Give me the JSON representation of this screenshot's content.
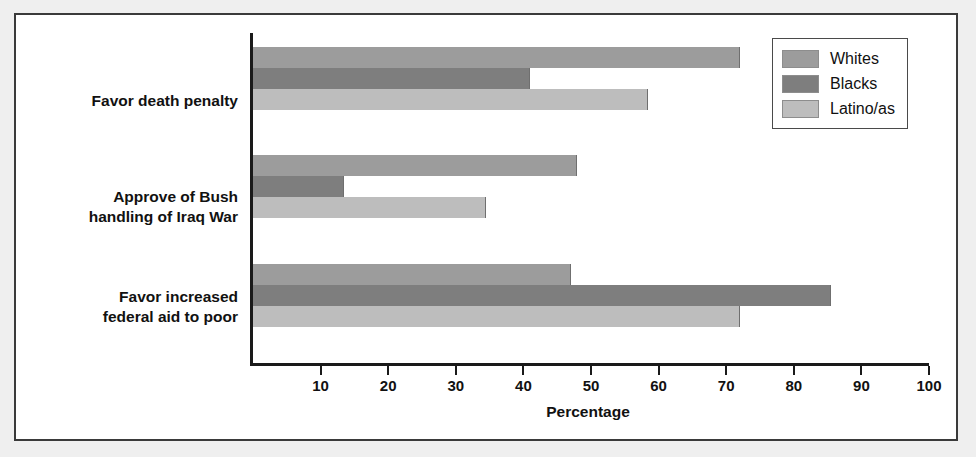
{
  "chart_data": {
    "type": "bar",
    "orientation": "horizontal",
    "title": "",
    "xlabel": "Percentage",
    "ylabel": "",
    "xlim": [
      0,
      100
    ],
    "xticks": [
      10,
      20,
      30,
      40,
      50,
      60,
      70,
      80,
      90,
      100
    ],
    "grid": false,
    "legend_position": "top-right",
    "categories": [
      "Favor death penalty",
      "Approve of Bush\nhandling of Iraq War",
      "Favor increased\nfederal aid to poor"
    ],
    "series": [
      {
        "name": "Whites",
        "color": "#9c9c9c",
        "values": [
          72,
          48,
          47
        ]
      },
      {
        "name": "Blacks",
        "color": "#7e7e7e",
        "values": [
          41,
          13.5,
          85.5
        ]
      },
      {
        "name": "Latino/as",
        "color": "#bdbdbd",
        "values": [
          58.5,
          34.5,
          72
        ]
      }
    ]
  },
  "legend": {
    "items": [
      {
        "label": "Whites",
        "color": "#9c9c9c"
      },
      {
        "label": "Blacks",
        "color": "#7e7e7e"
      },
      {
        "label": "Latino/as",
        "color": "#bdbdbd"
      }
    ]
  },
  "axis": {
    "x_title": "Percentage",
    "tick_labels": [
      "10",
      "20",
      "30",
      "40",
      "50",
      "60",
      "70",
      "80",
      "90",
      "100"
    ]
  },
  "colors": {
    "page_background": "#efefef",
    "panel_background": "#ffffff",
    "frame_border": "#3a3a3a",
    "axis": "#1a1a1a",
    "text": "#111111"
  }
}
